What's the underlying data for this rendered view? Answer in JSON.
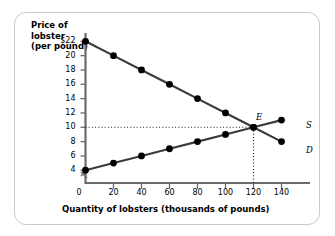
{
  "figure": {
    "y_axis_title_lines": [
      "Price of",
      "lobster",
      "(per pound)"
    ],
    "x_axis_title": "Quantity of lobsters (thousands of pounds)",
    "origin_label": "0",
    "equilibrium_label": "E",
    "supply_label": "S",
    "demand_label": "D",
    "axis_break": "axis-break-mark"
  },
  "chart_data": {
    "type": "line",
    "title": "",
    "xlabel": "Quantity of lobsters (thousands of pounds)",
    "ylabel": "Price of lobster (per pound)",
    "xlim": [
      0,
      150
    ],
    "ylim": [
      3,
      23
    ],
    "xticks": [
      0,
      20,
      40,
      60,
      80,
      100,
      120,
      140
    ],
    "xtick_labels": [
      "0",
      "20",
      "40",
      "60",
      "80",
      "100",
      "120",
      "140"
    ],
    "yticks": [
      4,
      6,
      8,
      10,
      12,
      14,
      16,
      18,
      20,
      22
    ],
    "ytick_labels": [
      "4",
      "6",
      "8",
      "10",
      "12",
      "14",
      "16",
      "18",
      "20",
      "$22"
    ],
    "grid": false,
    "legend_position": "curve-end-labels",
    "x": [
      0,
      20,
      40,
      60,
      80,
      100,
      120,
      140
    ],
    "series": [
      {
        "name": "D",
        "label": "Demand",
        "values": [
          22,
          20,
          18,
          16,
          14,
          12,
          10,
          8
        ],
        "color": "#3a3a3a",
        "marker": "filled-circle"
      },
      {
        "name": "S",
        "label": "Supply",
        "values": [
          4,
          5,
          6,
          7,
          8,
          9,
          10,
          11
        ],
        "color": "#3a3a3a",
        "marker": "filled-circle"
      }
    ],
    "annotations": [
      {
        "name": "E",
        "text": "E",
        "x": 120,
        "y": 10,
        "description": "equilibrium point"
      }
    ],
    "guide_lines": [
      {
        "name": "equilibrium-price-line",
        "orientation": "horizontal",
        "value": 10,
        "style": "dotted"
      },
      {
        "name": "equilibrium-quantity-line",
        "orientation": "vertical",
        "value": 120,
        "style": "dotted"
      }
    ]
  }
}
